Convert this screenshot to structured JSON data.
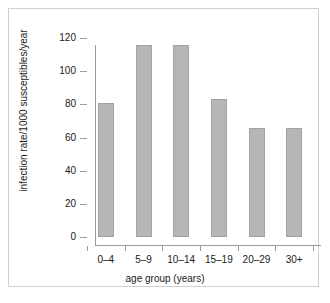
{
  "chart_data": {
    "type": "bar",
    "title": "",
    "subtitle": "",
    "categories": [
      "0–4",
      "5–9",
      "10–14",
      "15–19",
      "20–29",
      "30+"
    ],
    "values": [
      81,
      116,
      116,
      83,
      66,
      66
    ],
    "xlabel": "age group (years)",
    "ylabel": "infection rate/1000 susceptibles/year",
    "ylim": [
      0,
      120
    ],
    "yticks": [
      0,
      20,
      40,
      60,
      80,
      100,
      120
    ],
    "ytick_labels": [
      "0",
      "20",
      "40",
      "60",
      "80",
      "100",
      "120"
    ],
    "grid": false,
    "legend": null,
    "bar_color": "#b6b6b6",
    "bar_edge_color": "#a3a3a3",
    "axis_color": "#9a9a9a",
    "background_color": "#ffffff",
    "frame_color": "#cfcfcf",
    "annotations": []
  }
}
